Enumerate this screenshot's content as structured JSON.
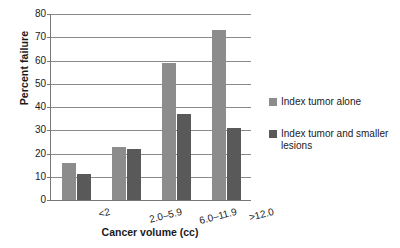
{
  "chart_data": {
    "type": "bar",
    "title": "",
    "subtitle": "",
    "xlabel": "Cancer volume (cc)",
    "ylabel": "Percent failure",
    "categories": [
      "<2",
      "2.0–5.9",
      "6.0–11.9",
      ">12.0"
    ],
    "series": [
      {
        "name": "Index tumor alone",
        "color": "#8c8c8c",
        "values": [
          16,
          23,
          59,
          73
        ]
      },
      {
        "name": "Index tumor and smaller lesions",
        "color": "#595959",
        "values": [
          11,
          22,
          37,
          31
        ]
      }
    ],
    "ylim": [
      0,
      80
    ],
    "yticks": [
      0,
      10,
      20,
      30,
      40,
      50,
      60,
      70,
      80
    ],
    "ytick_labels": [
      "0",
      "10",
      "20",
      "30",
      "40",
      "50",
      "60",
      "70",
      "80"
    ],
    "grid": true,
    "grid_axis": "y",
    "legend_position": "right",
    "background_color": "#ffffff",
    "axis_color": "#767676",
    "grid_color": "#8a8a8a"
  }
}
